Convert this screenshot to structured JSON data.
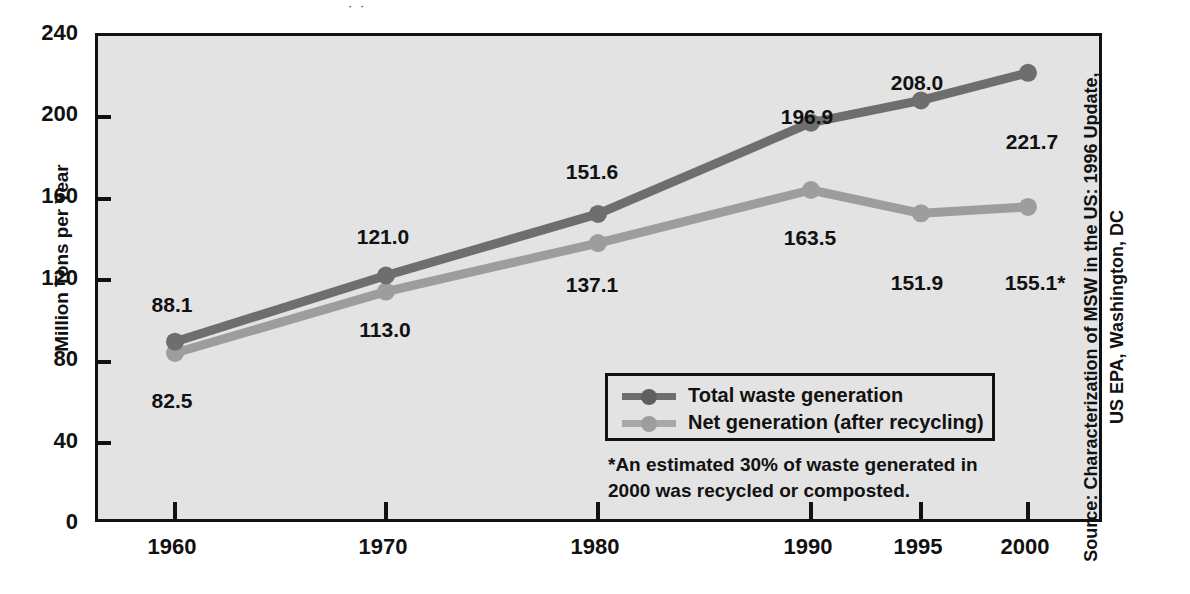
{
  "chart_data": {
    "type": "line",
    "title": "",
    "xlabel": "",
    "ylabel": "Million Tons per Year",
    "categories": [
      "1960",
      "1970",
      "1980",
      "1990",
      "1995",
      "2000"
    ],
    "x_positions": [
      1960,
      1970,
      1980,
      1990,
      1995,
      2000
    ],
    "ylim": [
      0,
      240
    ],
    "yticks": [
      0,
      40,
      80,
      120,
      160,
      200,
      240
    ],
    "ytick_labels": [
      "0",
      "40",
      "80",
      "120",
      "160",
      "200",
      "240"
    ],
    "grid": false,
    "legend_position": "inside-lower-right",
    "series": [
      {
        "name": "Total waste generation",
        "color": "#6e6e6e",
        "values": [
          88.1,
          121.0,
          151.6,
          196.9,
          208.0,
          221.7
        ],
        "labels": [
          "88.1",
          "121.0",
          "151.6",
          "196.9",
          "208.0",
          "221.7"
        ]
      },
      {
        "name": "Net generation (after recycling)",
        "color": "#9d9d9d",
        "values": [
          82.5,
          113.0,
          137.1,
          163.5,
          151.9,
          155.1
        ],
        "labels": [
          "82.5",
          "113.0",
          "137.1",
          "163.5",
          "151.9",
          "155.1*"
        ]
      }
    ],
    "annotations": [
      "*An estimated 30% of waste generated in 2000 was recycled or composted.",
      "Source: Characterization of MSW in the US: 1996 Update, US EPA, Washington, DC"
    ]
  },
  "axes": {
    "y_title": "Million Tons per Year",
    "y_ticks": [
      {
        "label": "240",
        "value": 240
      },
      {
        "label": "200",
        "value": 200
      },
      {
        "label": "160",
        "value": 160
      },
      {
        "label": "120",
        "value": 120
      },
      {
        "label": "80",
        "value": 80
      },
      {
        "label": "40",
        "value": 40
      },
      {
        "label": "0",
        "value": 0
      }
    ],
    "x_ticks": [
      {
        "label": "1960",
        "value": 1960
      },
      {
        "label": "1970",
        "value": 1970
      },
      {
        "label": "1980",
        "value": 1980
      },
      {
        "label": "1990",
        "value": 1990
      },
      {
        "label": "1995",
        "value": 1995
      },
      {
        "label": "2000",
        "value": 2000
      }
    ]
  },
  "point_labels": {
    "total": [
      {
        "text": "88.1",
        "x": 172,
        "y": 305
      },
      {
        "text": "121.0",
        "x": 383,
        "y": 237
      },
      {
        "text": "151.6",
        "x": 592,
        "y": 172
      },
      {
        "text": "196.9",
        "x": 807,
        "y": 117
      },
      {
        "text": "208.0",
        "x": 917,
        "y": 83
      },
      {
        "text": "221.7",
        "x": 1030,
        "y": 142
      }
    ],
    "net": [
      {
        "text": "82.5",
        "x": 172,
        "y": 401
      },
      {
        "text": "113.0",
        "x": 385,
        "y": 330
      },
      {
        "text": "137.1",
        "x": 592,
        "y": 285
      },
      {
        "text": "163.5",
        "x": 810,
        "y": 238
      },
      {
        "text": "151.9",
        "x": 917,
        "y": 283
      },
      {
        "text": "155.1*",
        "x": 1033,
        "y": 283
      }
    ]
  },
  "legend": {
    "items": [
      {
        "label": "Total waste generation",
        "color": "#6e6e6e"
      },
      {
        "label": "Net generation (after recycling)",
        "color": "#9d9d9d"
      }
    ]
  },
  "footnote": {
    "line1": "*An estimated 30% of waste generated in",
    "line2": "2000 was recycled or composted."
  },
  "source": {
    "line1": "Source: Characterization of MSW in the US: 1996 Update,",
    "line2": "US EPA, Washington, DC"
  },
  "colors": {
    "total_series": "#6e6e6e",
    "net_series": "#9d9d9d",
    "plot_background": "#e3e3e3",
    "frame": "#111111",
    "page_background": "#ffffff"
  },
  "title_remnant": "· ·"
}
